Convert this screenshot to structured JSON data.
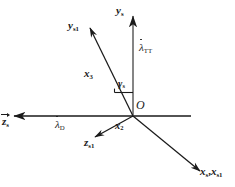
{
  "figure": {
    "type": "vector-coordinate-diagram",
    "background_color": "#ffffff",
    "line_color": "#1a1a1a",
    "origin": {
      "x": 133,
      "y": 116,
      "label": "O"
    }
  },
  "labels": {
    "origin": "O",
    "y_s": {
      "base": "y",
      "sub": "s"
    },
    "y_s1": {
      "base": "y",
      "sub": "s1"
    },
    "z_s_bar": {
      "base": "z",
      "sub": "s"
    },
    "z_s1": {
      "base": "z",
      "sub": "s1"
    },
    "x_s_x_s1": {
      "base1": "x",
      "sub1": "s",
      "sep": ",",
      "base2": "x",
      "sub2": "s1"
    },
    "x_2": {
      "base": "x",
      "sub": "2"
    },
    "x_3": {
      "base": "x",
      "sub": "3"
    },
    "lambda_TT": {
      "base": "λ",
      "sub": "TT"
    },
    "lambda_D": {
      "base": "λ",
      "sub": "D"
    },
    "gamma_s": {
      "base": "γ",
      "sub": "s"
    }
  },
  "axes": [
    {
      "name": "y-s-axis",
      "label": "y_s",
      "from": [
        133,
        116
      ],
      "to": [
        133,
        14
      ],
      "arrow": true,
      "note": "vertical up axis"
    },
    {
      "name": "horizontal-axis-left",
      "label": "z_s_bar",
      "from": [
        133,
        116
      ],
      "to": [
        11,
        116
      ],
      "arrow": true,
      "note": "horizontal left axis"
    },
    {
      "name": "horizontal-axis-right",
      "label": "",
      "from": [
        133,
        116
      ],
      "to": [
        191,
        116
      ],
      "arrow": false,
      "note": "horizontal right stub"
    },
    {
      "name": "y-s1-axis",
      "label": "y_s1",
      "from": [
        133,
        116
      ],
      "to": [
        88,
        26
      ],
      "arrow": true,
      "note": "rotated up-left axis"
    },
    {
      "name": "x-s-axis",
      "label": "x_s_x_s1",
      "from": [
        133,
        116
      ],
      "to": [
        203,
        173
      ],
      "arrow": true,
      "note": "down-right axis"
    },
    {
      "name": "z-s1-axis",
      "label": "z_s1",
      "from": [
        133,
        116
      ],
      "to": [
        92,
        139
      ],
      "arrow": true,
      "note": "down-left rotated axis"
    }
  ],
  "angle": {
    "name": "gamma_s",
    "between": [
      "y_s",
      "y_s1"
    ],
    "marker": "right-angle-tick"
  }
}
